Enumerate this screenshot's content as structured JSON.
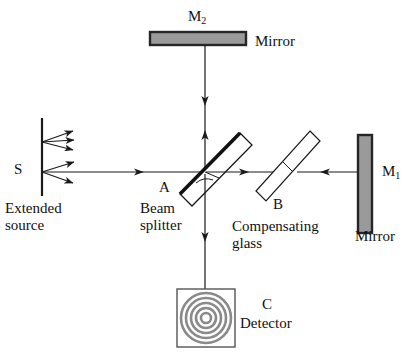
{
  "figure": {
    "background_color": "#ffffff",
    "line_color": "#1a1a1a",
    "mirror_fill_color": "#9a9a9a",
    "mirror_border_color": "#262626",
    "fringe_color": "#808080",
    "width": 412,
    "height": 360
  },
  "labels": {
    "mirror_m2": "M",
    "mirror_m2_sub": "2",
    "mirror_top_caption": "Mirror",
    "source_symbol": "S",
    "source_caption_line1": "Extended",
    "source_caption_line2": "source",
    "beamsplitter_point": "A",
    "beamsplitter_caption_line1": "Beam",
    "beamsplitter_caption_line2": "splitter",
    "compensator_point": "B",
    "compensator_caption_line1": "Compensating",
    "compensator_caption_line2": "glass",
    "mirror_m1": "M",
    "mirror_m1_sub": "1",
    "mirror_right_caption": "Mirror",
    "detector_point": "C",
    "detector_caption": "Detector"
  },
  "components": {
    "mirror_m2": {
      "name": "M2",
      "orientation": "horizontal",
      "x": 150,
      "y": 32,
      "width": 96,
      "height": 13
    },
    "mirror_m1": {
      "name": "M1",
      "orientation": "vertical",
      "x": 358,
      "y": 135,
      "width": 14,
      "height": 98
    },
    "beam_splitter": {
      "name": "A",
      "angle_deg": 45,
      "center_x": 216,
      "center_y": 172,
      "coated": true
    },
    "compensating_glass": {
      "name": "B",
      "angle_deg": 45,
      "center_x": 286,
      "center_y": 172,
      "coated": false
    },
    "detector": {
      "name": "C",
      "x": 177,
      "y": 289,
      "width": 58,
      "height": 58,
      "ring_count": 5
    },
    "source": {
      "name": "S",
      "x": 42,
      "y": 118,
      "height": 78,
      "ray_fans": 2,
      "rays_per_fan": 3
    }
  },
  "beam_paths": {
    "horizontal_beam_y": 172,
    "vertical_beam_x": 205,
    "source_to_splitter": {
      "from_x": 44,
      "to_x": 205,
      "y": 172,
      "arrow": "right"
    },
    "splitter_to_m2_up": {
      "x": 205,
      "from_y": 170,
      "to_y": 128,
      "arrow": "up"
    },
    "m2_to_splitter_down": {
      "x": 205,
      "from_y": 46,
      "to_y": 112,
      "arrow": "down"
    },
    "splitter_to_compensator": {
      "from_x": 207,
      "to_x": 272,
      "y": 172,
      "arrow": "right"
    },
    "m1_to_compensator": {
      "from_x": 356,
      "to_x": 300,
      "y": 172,
      "arrow": "left"
    },
    "splitter_to_detector": {
      "x": 205,
      "from_y": 176,
      "to_y": 289,
      "arrow": "down"
    }
  }
}
